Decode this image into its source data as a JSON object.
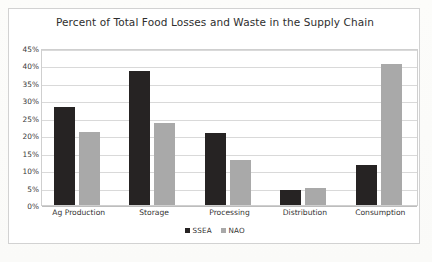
{
  "chart_data": {
    "type": "bar",
    "title": "Percent of Total Food Losses and Waste in the Supply Chain",
    "xlabel": "",
    "ylabel": "",
    "ylim": [
      0,
      45
    ],
    "ytick_labels": [
      "45%",
      "40%",
      "35%",
      "30%",
      "25%",
      "20%",
      "15%",
      "10%",
      "5%",
      "0%"
    ],
    "ytick_values": [
      45,
      40,
      35,
      30,
      25,
      20,
      15,
      10,
      5,
      0
    ],
    "grid": true,
    "legend_position": "bottom",
    "categories": [
      "Ag Production",
      "Storage",
      "Processing",
      "Distribution",
      "Consumption"
    ],
    "series": [
      {
        "name": "SSEA",
        "color": "#262323",
        "values": [
          28.0,
          38.5,
          20.7,
          4.2,
          11.5
        ]
      },
      {
        "name": "NAO",
        "color": "#a9a9a9",
        "values": [
          21.0,
          23.5,
          13.0,
          5.0,
          40.5
        ]
      }
    ]
  },
  "legend": {
    "items": [
      {
        "label": "SSEA",
        "color": "#262323"
      },
      {
        "label": "NAO",
        "color": "#a9a9a9"
      }
    ]
  }
}
